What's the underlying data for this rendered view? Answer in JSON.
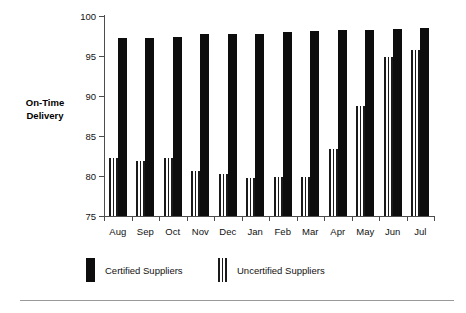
{
  "chart_data": {
    "type": "bar",
    "title": "",
    "xlabel": "",
    "ylabel": "On-Time\nDelivery",
    "ylim": [
      75,
      100
    ],
    "ytick_step": 5,
    "yticks": [
      75,
      80,
      85,
      90,
      95,
      100
    ],
    "ytick_labels": [
      "75",
      "80",
      "85",
      "90",
      "95",
      "100"
    ],
    "grid": false,
    "legend_position": "bottom",
    "categories": [
      "Aug",
      "Sep",
      "Oct",
      "Nov",
      "Dec",
      "Jan",
      "Feb",
      "Mar",
      "Apr",
      "May",
      "Jun",
      "Jul"
    ],
    "series": [
      {
        "name": "Certified Suppliers",
        "fill": "solid-black",
        "color": "#0d0d0d",
        "values": [
          97.3,
          97.3,
          97.4,
          97.7,
          97.8,
          97.8,
          98.0,
          98.1,
          98.2,
          98.3,
          98.4,
          98.5
        ]
      },
      {
        "name": "Uncertified Suppliers",
        "fill": "vertical-stripes",
        "color": "#1a1a1a",
        "values": [
          82.3,
          81.9,
          82.2,
          80.6,
          80.3,
          79.8,
          79.9,
          79.9,
          83.4,
          88.8,
          94.9,
          95.7
        ]
      }
    ]
  },
  "axis": {
    "y_title_line1": "On-Time",
    "y_title_line2": "Delivery"
  },
  "legend": {
    "items": [
      {
        "label": "Certified Suppliers",
        "swatch": "solid-black-swatch"
      },
      {
        "label": "Uncertified Suppliers",
        "swatch": "striped-swatch"
      }
    ]
  },
  "colors": {
    "certified": "#0d0d0d",
    "uncertified_stripe": "#1a1a1a",
    "axis": "#4d4d4d",
    "rule": "#9a9a9a",
    "background": "#ffffff"
  }
}
